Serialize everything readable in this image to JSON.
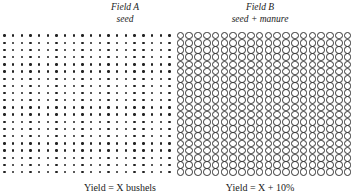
{
  "field_a": {
    "title": "Field A",
    "subtitle": "seed",
    "pattern": "dots",
    "rows": 20,
    "cols": 20,
    "yield_label": "Yield = X bushels"
  },
  "field_b": {
    "title": "Field B",
    "subtitle": "seed + manure",
    "pattern": "circles",
    "rows": 20,
    "cols": 20,
    "yield_label": "Yield = X + 10%"
  }
}
